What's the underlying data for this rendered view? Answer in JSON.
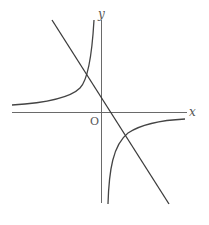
{
  "diagram": {
    "type": "coordinate-graph",
    "axes": {
      "x_label": "x",
      "y_label": "y",
      "origin_label": "O"
    },
    "elements": [
      {
        "name": "hyperbola-branch-left",
        "kind": "curve",
        "quadrant": "II"
      },
      {
        "name": "hyperbola-branch-right",
        "kind": "curve",
        "quadrant": "IV"
      },
      {
        "name": "line",
        "kind": "straight-line",
        "slope": "negative"
      }
    ],
    "colors": {
      "axis": "#6a6a6a",
      "curve": "#444444",
      "line": "#3a3a3a",
      "label": "#555555",
      "background": "#ffffff"
    }
  }
}
